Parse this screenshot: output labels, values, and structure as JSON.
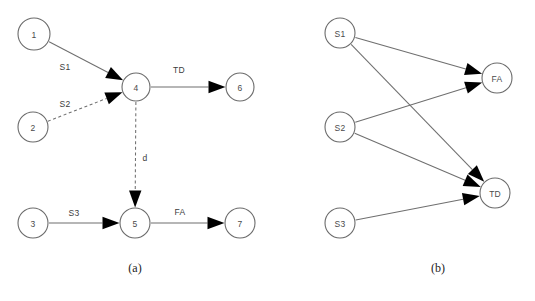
{
  "figure": {
    "background_color": "#ffffff",
    "node_stroke_color": "#6b6b6b",
    "edge_stroke_color": "#6f6f6f",
    "arrow_color": "#000000",
    "text_color": "#3c3c3c"
  },
  "panel_a": {
    "caption": "(a)",
    "caption_x": 135,
    "caption_y": 268,
    "nodes": [
      {
        "id": "n1",
        "label": "1",
        "cx": 34,
        "cy": 34,
        "r": 16
      },
      {
        "id": "n2",
        "label": "2",
        "cx": 33,
        "cy": 127,
        "r": 15
      },
      {
        "id": "n3",
        "label": "3",
        "cx": 33,
        "cy": 223,
        "r": 15
      },
      {
        "id": "n4",
        "label": "4",
        "cx": 136,
        "cy": 87,
        "r": 14
      },
      {
        "id": "n5",
        "label": "5",
        "cx": 135,
        "cy": 223,
        "r": 15
      },
      {
        "id": "n6",
        "label": "6",
        "cx": 240,
        "cy": 87,
        "r": 14
      },
      {
        "id": "n7",
        "label": "7",
        "cx": 240,
        "cy": 223,
        "r": 15
      }
    ],
    "edges": [
      {
        "id": "e-1-4",
        "from": "n1",
        "to": "n4",
        "label": "S1",
        "label_x": 65,
        "label_y": 67,
        "style": "solid"
      },
      {
        "id": "e-2-4",
        "from": "n2",
        "to": "n4",
        "label": "S2",
        "label_x": 65,
        "label_y": 104,
        "style": "dashed"
      },
      {
        "id": "e-4-6",
        "from": "n4",
        "to": "n6",
        "label": "TD",
        "label_x": 179,
        "label_y": 70,
        "style": "solid"
      },
      {
        "id": "e-4-5",
        "from": "n4",
        "to": "n5",
        "label": "d",
        "label_x": 145,
        "label_y": 158,
        "style": "dashed"
      },
      {
        "id": "e-3-5",
        "from": "n3",
        "to": "n5",
        "label": "S3",
        "label_x": 74,
        "label_y": 213,
        "style": "solid"
      },
      {
        "id": "e-5-7",
        "from": "n5",
        "to": "n7",
        "label": "FA",
        "label_x": 180,
        "label_y": 212,
        "style": "solid"
      }
    ]
  },
  "panel_b": {
    "caption": "(b)",
    "caption_x": 438,
    "caption_y": 268,
    "nodes": [
      {
        "id": "s1",
        "label": "S1",
        "cx": 340,
        "cy": 33,
        "r": 15
      },
      {
        "id": "s2",
        "label": "S2",
        "cx": 340,
        "cy": 127,
        "r": 15
      },
      {
        "id": "s3",
        "label": "S3",
        "cx": 340,
        "cy": 223,
        "r": 15
      },
      {
        "id": "fa",
        "label": "FA",
        "cx": 497,
        "cy": 78,
        "r": 15
      },
      {
        "id": "td",
        "label": "TD",
        "cx": 495,
        "cy": 193,
        "r": 15
      }
    ],
    "edges": [
      {
        "id": "e-s1-fa",
        "from": "s1",
        "to": "fa",
        "label": "",
        "style": "solid"
      },
      {
        "id": "e-s1-td",
        "from": "s1",
        "to": "td",
        "label": "",
        "style": "solid"
      },
      {
        "id": "e-s2-fa",
        "from": "s2",
        "to": "fa",
        "label": "",
        "style": "solid"
      },
      {
        "id": "e-s2-td",
        "from": "s2",
        "to": "td",
        "label": "",
        "style": "solid"
      },
      {
        "id": "e-s3-td",
        "from": "s3",
        "to": "td",
        "label": "",
        "style": "solid"
      }
    ]
  }
}
